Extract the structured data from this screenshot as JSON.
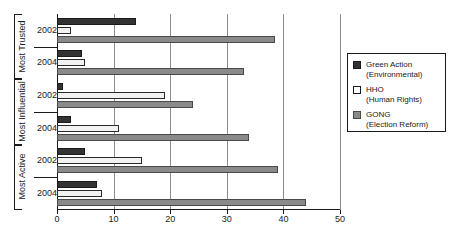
{
  "chart_data": {
    "type": "bar",
    "orientation": "horizontal",
    "title": "",
    "xlabel": "",
    "ylabel": "",
    "xlim": [
      0,
      50
    ],
    "xticks": [
      0,
      10,
      20,
      30,
      40,
      50
    ],
    "grid": true,
    "legend_position": "right",
    "groups": [
      {
        "label": "Most Trusted",
        "rows": [
          {
            "label": "2002",
            "values": [
              14,
              2.5,
              38.5
            ]
          },
          {
            "label": "2004",
            "values": [
              4.5,
              5,
              33
            ]
          }
        ]
      },
      {
        "label": "Most Influential",
        "rows": [
          {
            "label": "2002",
            "values": [
              1,
              19,
              24
            ]
          },
          {
            "label": "2004",
            "values": [
              2.5,
              11,
              34
            ]
          }
        ]
      },
      {
        "label": "Most Active",
        "rows": [
          {
            "label": "2002",
            "values": [
              5,
              15,
              39
            ]
          },
          {
            "label": "2004",
            "values": [
              7,
              8,
              44
            ]
          }
        ]
      }
    ],
    "series": [
      {
        "name": "Green Action",
        "subtitle": "(Environmental)",
        "color": "#333333",
        "values": [
          14,
          4.5,
          1,
          2.5,
          5,
          7
        ]
      },
      {
        "name": "HHO",
        "subtitle": "(Human Rights)",
        "color": "#ffffff",
        "values": [
          2.5,
          5,
          19,
          11,
          15,
          8
        ]
      },
      {
        "name": "GONG",
        "subtitle": "(Election Reform)",
        "color": "#8a8a8a",
        "values": [
          38.5,
          33,
          24,
          34,
          39,
          44
        ]
      }
    ],
    "categories": [
      "Most Trusted 2002",
      "Most Trusted 2004",
      "Most Influential 2002",
      "Most Influential 2004",
      "Most Active 2002",
      "Most Active 2004"
    ]
  },
  "legend": {
    "items": [
      {
        "name": "Green Action",
        "subtitle": "(Environmental)",
        "swatch": "green"
      },
      {
        "name": "HHO",
        "subtitle": "(Human Rights)",
        "swatch": "hho"
      },
      {
        "name": "GONG",
        "subtitle": "(Election Reform)",
        "swatch": "gong"
      }
    ]
  }
}
